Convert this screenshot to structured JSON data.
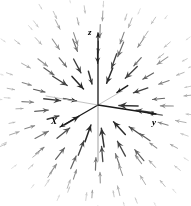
{
  "figure": {
    "title": "",
    "width": 191,
    "height": 206,
    "background_color": "#ffffff"
  },
  "axes": {
    "origin": {
      "x": 98,
      "y": 105
    },
    "items": [
      {
        "name": "z-axis",
        "label": "z",
        "label_x": 88,
        "label_y": 28,
        "tip_x": 98,
        "tip_y": 33,
        "tail_x": 98,
        "tail_y": 105,
        "negative_tip_x": 98,
        "negative_tip_y": 161,
        "color": "#1a1a1a",
        "negative_color": "#9a9a9a",
        "width": 1.3,
        "arrow": true
      },
      {
        "name": "x-axis",
        "label": "X",
        "label_x": 51,
        "label_y": 117,
        "tip_x": 60,
        "tip_y": 127,
        "tail_x": 98,
        "tail_y": 105,
        "negative_tip_x": 122,
        "negative_tip_y": 91,
        "color": "#1a1a1a",
        "negative_color": "#bfbfbf",
        "width": 1.3,
        "arrow": true
      },
      {
        "name": "y-axis",
        "label": "y",
        "label_x": 152,
        "label_y": 118,
        "tip_x": 156,
        "tip_y": 114,
        "tail_x": 98,
        "tail_y": 105,
        "negative_tip_x": 46,
        "negative_tip_y": 96,
        "color": "#1a1a1a",
        "negative_color": "#bfbfbf",
        "width": 1.3,
        "arrow": true
      }
    ]
  },
  "chart_data": {
    "type": "scatter",
    "plot_kind": "3d-vector-field",
    "title": "",
    "xlabel": "X",
    "ylabel": "y",
    "zlabel": "z",
    "field": {
      "direction": "inward",
      "center_x": 98,
      "center_y": 105,
      "ring_count": 7,
      "rings": [
        {
          "radius": 22,
          "count": 10,
          "length": 16,
          "gray": 40,
          "width": 1.5
        },
        {
          "radius": 38,
          "count": 14,
          "length": 15,
          "gray": 70,
          "width": 1.35
        },
        {
          "radius": 53,
          "count": 18,
          "length": 13,
          "gray": 108,
          "width": 1.2
        },
        {
          "radius": 67,
          "count": 20,
          "length": 11,
          "gray": 140,
          "width": 1.05
        },
        {
          "radius": 80,
          "count": 22,
          "length": 9,
          "gray": 168,
          "width": 0.95
        },
        {
          "radius": 92,
          "count": 24,
          "length": 7,
          "gray": 192,
          "width": 0.85
        },
        {
          "radius": 104,
          "count": 26,
          "length": 5,
          "gray": 212,
          "width": 0.8
        }
      ],
      "ring_phase_offsets": [
        0.22,
        0.1,
        0.31,
        0.05,
        0.26,
        0.14,
        0.36
      ],
      "jitter_amount": 0.34,
      "arrowhead_scale": 0.42,
      "gray_jitter": 26,
      "clip_margin": 3
    },
    "legend": {
      "entries": [],
      "position": "none"
    },
    "grid": false
  }
}
